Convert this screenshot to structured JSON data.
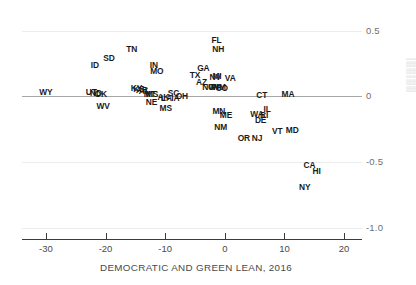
{
  "chart_data": {
    "type": "scatter",
    "title": "",
    "xlabel": "DEMOCRATIC AND GREEN LEAN, 2016",
    "ylabel": "",
    "xlim": [
      -34,
      23
    ],
    "ylim": [
      -1.0,
      0.58
    ],
    "xticks": [
      "-30",
      "-20",
      "-10",
      "0",
      "10",
      "20"
    ],
    "xtick_values": [
      -30,
      -20,
      -10,
      0,
      10,
      20
    ],
    "yticks": [
      "0.5",
      "0",
      "-0.5",
      "-1.0"
    ],
    "ytick_values": [
      0.5,
      0,
      -0.5,
      -1.0
    ],
    "grid": "horizontal",
    "gridlines": [
      0.5,
      0,
      -0.5,
      -1.0
    ],
    "zero_line": 0,
    "legend": "none",
    "point_label_field": "state",
    "points": [
      {
        "state": "WY",
        "x": -30.0,
        "y": 0.035
      },
      {
        "state": "UT",
        "x": -22.4,
        "y": 0.03
      },
      {
        "state": "ND",
        "x": -21.6,
        "y": 0.022
      },
      {
        "state": "OK",
        "x": -20.8,
        "y": 0.02
      },
      {
        "state": "ID",
        "x": -21.8,
        "y": 0.235
      },
      {
        "state": "SD",
        "x": -19.4,
        "y": 0.29
      },
      {
        "state": "WV",
        "x": -20.4,
        "y": -0.07
      },
      {
        "state": "TN",
        "x": -15.6,
        "y": 0.36
      },
      {
        "state": "KY",
        "x": -14.8,
        "y": 0.06
      },
      {
        "state": "KS",
        "x": -14.4,
        "y": 0.058
      },
      {
        "state": "AR",
        "x": -13.9,
        "y": 0.046
      },
      {
        "state": "AL",
        "x": -13.5,
        "y": 0.04
      },
      {
        "state": "MO",
        "x": -11.4,
        "y": 0.19
      },
      {
        "state": "IN",
        "x": -11.9,
        "y": 0.235
      },
      {
        "state": "MT",
        "x": -12.6,
        "y": 0.02
      },
      {
        "state": "MS",
        "x": -12.2,
        "y": 0.018
      },
      {
        "state": "NE",
        "x": -12.3,
        "y": -0.04
      },
      {
        "state": "AK",
        "x": -10.3,
        "y": -0.008
      },
      {
        "state": "LA",
        "x": -9.8,
        "y": -0.014
      },
      {
        "state": "MS",
        "x": -9.9,
        "y": -0.085
      },
      {
        "state": "SC",
        "x": -8.6,
        "y": 0.022
      },
      {
        "state": "IA",
        "x": -8.3,
        "y": -0.012
      },
      {
        "state": "OH",
        "x": -7.2,
        "y": 0.004
      },
      {
        "state": "TX",
        "x": -5.0,
        "y": 0.16
      },
      {
        "state": "GA",
        "x": -3.6,
        "y": 0.215
      },
      {
        "state": "AZ",
        "x": -3.9,
        "y": 0.11
      },
      {
        "state": "NC",
        "x": -2.8,
        "y": 0.068
      },
      {
        "state": "WI",
        "x": -1.9,
        "y": 0.072
      },
      {
        "state": "NV",
        "x": -1.6,
        "y": 0.15
      },
      {
        "state": "MI",
        "x": -1.3,
        "y": 0.152
      },
      {
        "state": "PA",
        "x": -1.4,
        "y": 0.07
      },
      {
        "state": "NM",
        "x": -0.9,
        "y": 0.068
      },
      {
        "state": "CO",
        "x": -0.5,
        "y": 0.066
      },
      {
        "state": "FL",
        "x": -1.4,
        "y": 0.43
      },
      {
        "state": "NH",
        "x": -1.1,
        "y": 0.36
      },
      {
        "state": "VA",
        "x": 0.9,
        "y": 0.14
      },
      {
        "state": "MN",
        "x": -1.0,
        "y": -0.11
      },
      {
        "state": "ME",
        "x": 0.2,
        "y": -0.145
      },
      {
        "state": "NM",
        "x": -0.7,
        "y": -0.235
      },
      {
        "state": "OR",
        "x": 3.2,
        "y": -0.32
      },
      {
        "state": "NJ",
        "x": 5.4,
        "y": -0.315
      },
      {
        "state": "CT",
        "x": 6.2,
        "y": 0.012
      },
      {
        "state": "MA",
        "x": 10.6,
        "y": 0.02
      },
      {
        "state": "IL",
        "x": 7.1,
        "y": -0.095
      },
      {
        "state": "WA",
        "x": 5.4,
        "y": -0.135
      },
      {
        "state": "RI",
        "x": 6.6,
        "y": -0.145
      },
      {
        "state": "DE",
        "x": 6.0,
        "y": -0.18
      },
      {
        "state": "VT",
        "x": 8.8,
        "y": -0.265
      },
      {
        "state": "MD",
        "x": 11.3,
        "y": -0.255
      },
      {
        "state": "CA",
        "x": 14.2,
        "y": -0.525
      },
      {
        "state": "HI",
        "x": 15.4,
        "y": -0.565
      },
      {
        "state": "NY",
        "x": 13.4,
        "y": -0.69
      }
    ]
  },
  "edge_text": "000000000000000000000000000000000000000000000000000000000000"
}
